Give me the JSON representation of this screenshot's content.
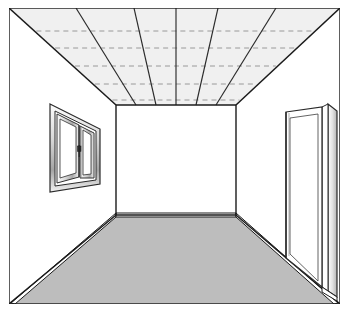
{
  "drawing": {
    "title": "Room Interior One-Point Perspective",
    "subject": "empty room interior",
    "projection": "one-point perspective",
    "canvas": {
      "width": 350,
      "height": 317
    },
    "border": {
      "x": 9,
      "y": 8,
      "width": 331,
      "height": 296,
      "stroke": "#1a1a1a",
      "stroke_width": 1.4
    }
  },
  "palette": {
    "paper": "#ffffff",
    "ink": "#1a1a1a",
    "ink_soft": "#555555",
    "dash": "#8e8e8e",
    "ceiling_fill": "#f0f0f0",
    "floor_fill": "#bdbdbd",
    "wall_fill": "#ffffff",
    "frame_light": "#f2f2f2",
    "frame_mid": "#c9c9c9",
    "frame_dark": "#8a8a8a"
  },
  "geometry": {
    "outer": {
      "left": 9,
      "top": 8,
      "right": 340,
      "bottom": 304
    },
    "back_wall": {
      "left": 116,
      "top": 105,
      "right": 236,
      "bottom": 215
    },
    "vanishing_point": {
      "x": 176,
      "y": 160
    }
  },
  "elements": {
    "ceiling": {
      "name": "Ceiling plane",
      "fill": "#f0f0f0",
      "rib_count": 7,
      "dashed_row_count": 5,
      "dashed_rows_y": [
        23,
        40,
        58,
        76,
        92
      ],
      "has_center_rib": true
    },
    "floor": {
      "name": "Floor plane",
      "fill": "#bdbdbd",
      "has_baseboard": true,
      "baseboard_label": "skirting board"
    },
    "left_wall": {
      "name": "Left wall",
      "fill": "#ffffff",
      "contains": "window"
    },
    "right_wall": {
      "name": "Right wall",
      "fill": "#ffffff",
      "contains": "door"
    },
    "back_wall": {
      "name": "Back wall",
      "fill": "#ffffff",
      "contains": "none"
    },
    "window": {
      "name": "Double casement window",
      "sash_count": 2,
      "has_handle": true,
      "handle_label": "window handle",
      "wall": "left"
    },
    "door": {
      "name": "Door in opening",
      "state": "open",
      "wall": "right",
      "has_frame": true,
      "panel_count": 1
    }
  }
}
